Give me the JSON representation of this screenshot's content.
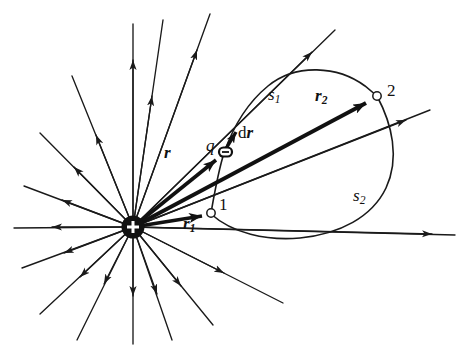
{
  "figure": {
    "background_color": "#ffffff",
    "ink_color": "#1a1a1a",
    "width": 468,
    "height": 358
  },
  "charge": {
    "name": "positive-point-charge",
    "symbol": "+",
    "center_x": 133,
    "center_y": 227,
    "radius": 11,
    "fill_color": "#111111",
    "symbol_color": "#ffffff"
  },
  "field": {
    "line_count": 18,
    "color": "#1a1a1a",
    "direction": "outward",
    "arrowheads": true
  },
  "points": [
    {
      "name": "point-1",
      "label": "1",
      "x": 211,
      "y": 213,
      "marker": "open-circle"
    },
    {
      "name": "point-2",
      "label": "2",
      "x": 377,
      "y": 96,
      "marker": "open-circle"
    }
  ],
  "test_charge": {
    "name": "test-charge-q",
    "label": "q",
    "x": 226,
    "y": 152,
    "marker": "small-open-rect"
  },
  "vectors": [
    {
      "name": "vector-r1",
      "label": "r",
      "subscript": "1",
      "label_x": 187,
      "label_y": 223,
      "from_x": 133,
      "from_y": 227,
      "to_x": 208,
      "to_y": 215,
      "style": "bold-arrow"
    },
    {
      "name": "vector-r",
      "label": "r",
      "subscript": "",
      "label_x": 167,
      "label_y": 154,
      "from_x": 133,
      "from_y": 227,
      "to_x": 224,
      "to_y": 154,
      "style": "bold-arrow"
    },
    {
      "name": "vector-r2",
      "label": "r",
      "subscript": "2",
      "label_x": 319,
      "label_y": 96,
      "from_x": 133,
      "from_y": 227,
      "to_x": 374,
      "to_y": 98,
      "style": "bold-arrow"
    },
    {
      "name": "vector-dr",
      "label": "d",
      "label_italic": "r",
      "subscript": "",
      "label_x": 240,
      "label_y": 133,
      "from_x": 224,
      "from_y": 152,
      "to_x": 243,
      "to_y": 124,
      "style": "bold-arrow-short"
    }
  ],
  "paths": [
    {
      "name": "path-s1",
      "label": "s",
      "subscript": "1",
      "label_x": 272,
      "label_y": 95,
      "description": "upper path from point 1 through q arcing to point 2"
    },
    {
      "name": "path-s2",
      "label": "s",
      "subscript": "2",
      "label_x": 357,
      "label_y": 196,
      "description": "lower return path from point 2 looping below back to point 1"
    }
  ]
}
